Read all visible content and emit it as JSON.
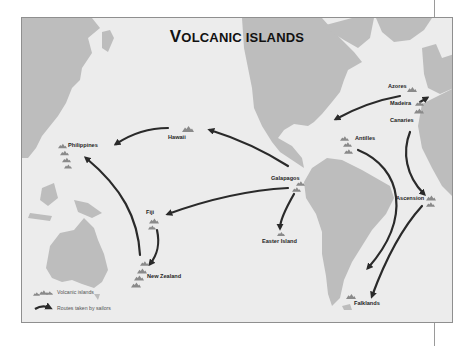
{
  "map": {
    "title_first_letter": "V",
    "title_rest": "OLCANIC ISLANDS",
    "title_full": "Volcanic islands",
    "colors": {
      "ocean": "#ececec",
      "land": "#bdbdbd",
      "island_marker": "#8a8a8a",
      "route_arrow": "#2a2a2a",
      "frame_border": "#8f8f8f"
    },
    "islands": [
      {
        "name": "Azores",
        "label": "Azores"
      },
      {
        "name": "Madeira",
        "label": "Madeira"
      },
      {
        "name": "Canaries",
        "label": "Canaries"
      },
      {
        "name": "Antilles",
        "label": "Antilles"
      },
      {
        "name": "Hawaii",
        "label": "Hawaii"
      },
      {
        "name": "Philippines",
        "label": "Philippines"
      },
      {
        "name": "Galapagos",
        "label": "Galapagos"
      },
      {
        "name": "Fiji",
        "label": "Fiji"
      },
      {
        "name": "Easter Island",
        "label": "Easter Island"
      },
      {
        "name": "New Zealand",
        "label": "New Zealand"
      },
      {
        "name": "Ascension",
        "label": "Ascension"
      },
      {
        "name": "Falklands",
        "label": "Falklands"
      }
    ],
    "routes": [
      {
        "from": "Azores",
        "to": "North America / Caribbean"
      },
      {
        "from": "Hawaii",
        "to": "Philippines"
      },
      {
        "from": "Galapagos",
        "to": "Hawaii"
      },
      {
        "from": "Galapagos",
        "to": "Fiji"
      },
      {
        "from": "Galapagos",
        "to": "Easter Island"
      },
      {
        "from": "Fiji",
        "to": "New Zealand"
      },
      {
        "from": "New Zealand",
        "to": "Philippines"
      },
      {
        "from": "Canaries",
        "to": "Ascension"
      },
      {
        "from": "Antilles",
        "to": "South America (south)"
      },
      {
        "from": "Ascension",
        "to": "Falklands"
      }
    ],
    "legend": {
      "volcanic_islands": "Volcanic islands",
      "routes": "Routes taken by sailors"
    }
  }
}
